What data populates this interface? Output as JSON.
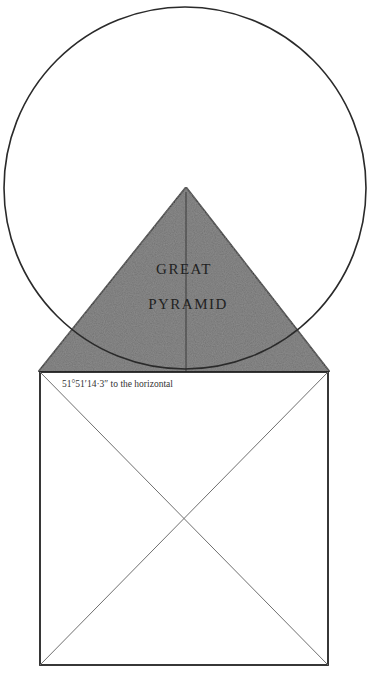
{
  "figure": {
    "type": "geometric diagram",
    "labels": {
      "pyramid_line1": "GREAT",
      "pyramid_line2": "PYRAMID",
      "angle": "51°51′14·3″ to the horizontal"
    },
    "colors": {
      "background": "#ffffff",
      "stroke": "#2a2a2a",
      "pyramid_fill": "#6e6e6e",
      "diagonal_stroke": "#7a7a7a"
    },
    "shapes": {
      "circle": {
        "cx": 185,
        "cy": 188,
        "r": 181
      },
      "pyramid": {
        "apex": [
          186,
          187
        ],
        "base_left": [
          38,
          372
        ],
        "base_right": [
          330,
          372
        ]
      },
      "square": {
        "x": 40,
        "y": 372,
        "width": 288,
        "height": 293
      },
      "diagonals_cross": [
        184,
        518
      ]
    }
  }
}
